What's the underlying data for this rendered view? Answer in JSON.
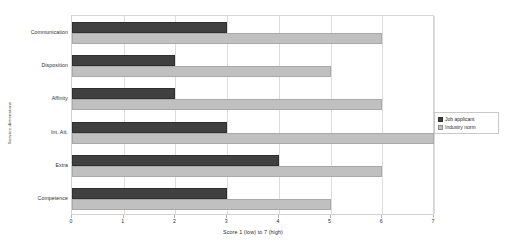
{
  "chart_data": {
    "type": "bar",
    "orientation": "horizontal",
    "title": "",
    "xlabel": "Score 1 (low) to 7 (high)",
    "ylabel": "Service dimensions",
    "xlim": [
      0,
      7
    ],
    "xticks": [
      0,
      1,
      2,
      3,
      4,
      5,
      6,
      7
    ],
    "grid": true,
    "legend_position": "right",
    "categories": [
      "Communication",
      "Disposition",
      "Affinity",
      "Int. Att.",
      "Extra",
      "Competence"
    ],
    "series": [
      {
        "name": "Job applicant",
        "color": "#404040",
        "values": [
          3,
          2,
          2,
          3,
          4,
          3
        ]
      },
      {
        "name": "Industry norm",
        "color": "#c0c0c0",
        "values": [
          6,
          5,
          6,
          7,
          6,
          5
        ]
      }
    ]
  },
  "legend": {
    "entries": [
      {
        "label": "Job applicant",
        "swatch": "applicant"
      },
      {
        "label": "Industry norm",
        "swatch": "norm"
      }
    ]
  }
}
